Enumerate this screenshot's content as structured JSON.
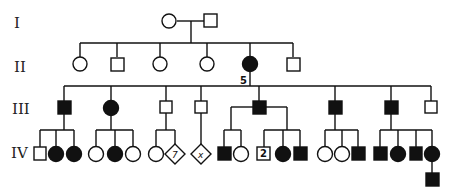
{
  "generations": [
    "I",
    "II",
    "III",
    "IV"
  ],
  "annotations": {
    "II_5_label": "5",
    "IV_diamond_count": "7",
    "IV_diamond_unknown": "x",
    "IV_square_count": "2"
  },
  "legend_semantics": {
    "filled": "affected",
    "open": "unaffected",
    "circle": "female",
    "square": "male",
    "diamond": "sex unspecified"
  },
  "colors": {
    "line": "#111111",
    "affected": "#111111",
    "background": "#ffffff"
  }
}
